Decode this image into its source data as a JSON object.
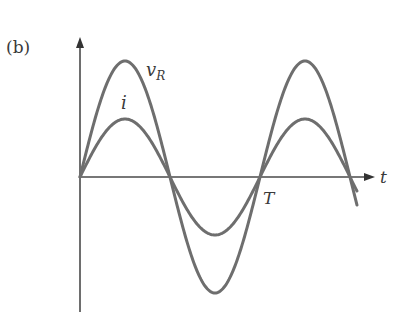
{
  "figure": {
    "panel_label": "(b)",
    "axes": {
      "x_label": "t",
      "y_axis_arrow": true
    },
    "curves": [
      {
        "name": "v",
        "subscript": "R",
        "amplitude_px": 116,
        "color": "#6e6e6e"
      },
      {
        "name": "i",
        "amplitude_px": 58,
        "color": "#6e6e6e"
      }
    ],
    "annotations": {
      "period_label": "T"
    },
    "colors": {
      "axis": "#4a4a4a",
      "curve": "#6e6e6e",
      "text": "#3a3a3a"
    }
  }
}
